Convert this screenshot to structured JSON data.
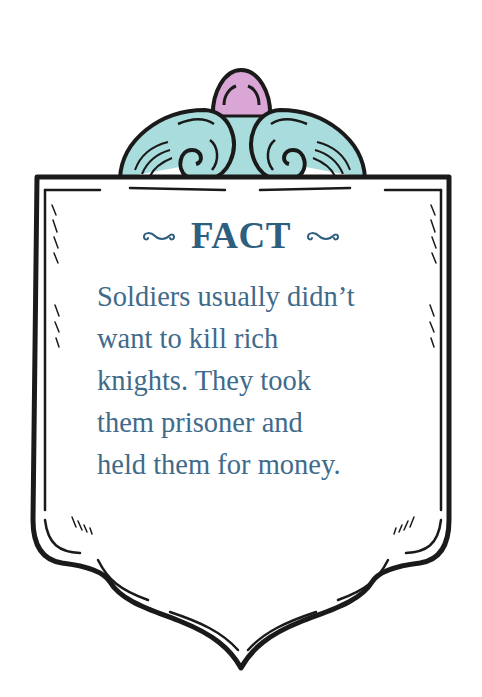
{
  "card": {
    "title": "FACT",
    "lines": [
      "Soldiers usually didn’t",
      "want to kill rich",
      "knights. They took",
      "them prisoner and",
      "held them for money."
    ],
    "colors": {
      "title": "#2e5f7f",
      "body_text": "#3f6b8b",
      "scroll_ornament": "#a9dcdc",
      "orb_ornament": "#d9a6d6",
      "outline": "#1a1a1a",
      "background": "#ffffff"
    }
  },
  "icons": {
    "left_swash": "swash-ornament",
    "right_swash": "swash-ornament",
    "crest": "scroll-crest-with-orb"
  }
}
